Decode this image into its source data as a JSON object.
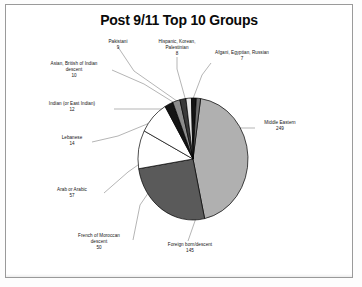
{
  "document": {
    "title": "Post 9/11 Top 10 Groups"
  },
  "chart_data": {
    "type": "pie",
    "title": "Post 9/11 Top 10 Groups",
    "xlabel": "",
    "ylabel": "",
    "total": 561,
    "legend": "none (direct labels with leader lines)",
    "grid": false,
    "categories": [
      "Middle Eastern",
      "Foreign born/descent",
      "Arab or Arabic",
      "French of Moroccan descent",
      "Lebanese",
      "Indian (or East Indian)",
      "Asian, British of Indian descent",
      "Pakistani",
      "Hispanic, Korean, Palestinian",
      "Afgani, Egyptian, Russian"
    ],
    "values": [
      249,
      145,
      57,
      50,
      14,
      12,
      10,
      9,
      8,
      7
    ],
    "slices": [
      {
        "label": "Middle Eastern",
        "value": 249,
        "color": "#b0b0b0"
      },
      {
        "label": "Foreign born/descent",
        "value": 145,
        "color": "#5a5a5a"
      },
      {
        "label": "Arab or Arabic",
        "value": 57,
        "color": "#ffffff"
      },
      {
        "label": "French of Moroccan descent",
        "value": 50,
        "color": "#ffffff"
      },
      {
        "label": "Lebanese",
        "value": 14,
        "color": "#141414"
      },
      {
        "label": "Indian (or East Indian)",
        "value": 12,
        "color": "#8c8c8c"
      },
      {
        "label": "Asian, British of Indian descent",
        "value": 10,
        "color": "#3a3a3a"
      },
      {
        "label": "Pakistani",
        "value": 9,
        "color": "#e8e8e8"
      },
      {
        "label": "Hispanic, Korean, Palestinian",
        "value": 8,
        "color": "#141414"
      },
      {
        "label": "Afgani, Egyptian, Russian",
        "value": 7,
        "color": "#6f6f6f"
      }
    ]
  },
  "labels": {
    "pakistani": {
      "name": "Pakistani",
      "value": "9"
    },
    "hispanic_korean_palestinian": {
      "name_line1": "Hispanic, Korean,",
      "name_line2": "Palestinian",
      "value": "8"
    },
    "afgani_egyptian_russian": {
      "name": "Afgani, Egyptian, Russian",
      "value": "7"
    },
    "asian_british": {
      "name_line1": "Asian, British of Indian",
      "name_line2": "descent",
      "value": "10"
    },
    "indian_east_indian": {
      "name": "Indian (or East Indian)",
      "value": "12"
    },
    "lebanese": {
      "name": "Lebanese",
      "value": "14"
    },
    "arab_or_arabic": {
      "name": "Arab or Arabic",
      "value": "57"
    },
    "french_moroccan": {
      "name_line1": "French of Moroccan",
      "name_line2": "descent",
      "value": "50"
    },
    "foreign_born": {
      "name": "Foreign born/descent",
      "value": "145"
    },
    "middle_eastern": {
      "name": "Middle Eastern",
      "value": "249"
    }
  },
  "colors": {
    "page_background": "#ffffff",
    "frame_border": "#9a9a9a",
    "text": "#141414",
    "leader_line": "#6b6b6b",
    "slice_outline": "#000000"
  }
}
